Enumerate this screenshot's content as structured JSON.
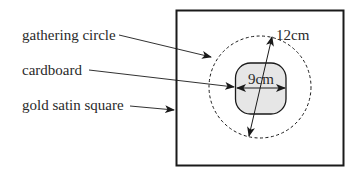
{
  "labels": {
    "gathering_circle": "gathering circle",
    "cardboard": "cardboard",
    "gold_satin_square": "gold satin square"
  },
  "dimensions": {
    "outer": "12cm",
    "inner": "9cm"
  },
  "colors": {
    "stroke": "#1a1a1a",
    "cardboard_fill": "#e6e6e6",
    "background": "#ffffff"
  }
}
